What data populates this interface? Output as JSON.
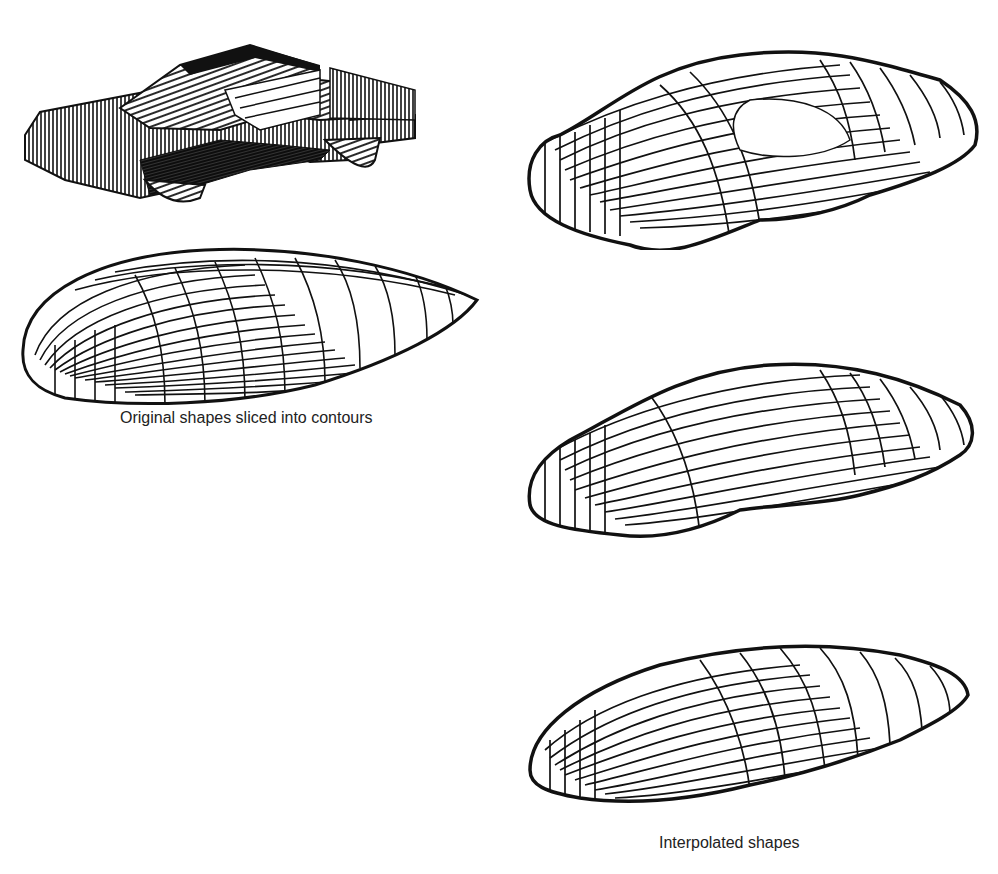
{
  "figure": {
    "left_group": {
      "caption": "Original shapes sliced into contours",
      "shapes": [
        {
          "id": "original-car",
          "description": "Blocky car model sliced into contour lines"
        },
        {
          "id": "original-ellipsoid",
          "description": "Smooth teardrop/ellipsoid shape sliced into contour lines"
        }
      ]
    },
    "right_group": {
      "caption": "Interpolated shapes",
      "shapes": [
        {
          "id": "interpolated-1",
          "description": "Interpolated shape close to car"
        },
        {
          "id": "interpolated-2",
          "description": "Interpolated shape midway between car and ellipsoid"
        },
        {
          "id": "interpolated-3",
          "description": "Interpolated shape close to ellipsoid"
        }
      ]
    },
    "colors": {
      "line": "#111111",
      "background": "#ffffff",
      "caption": "#222222"
    }
  }
}
